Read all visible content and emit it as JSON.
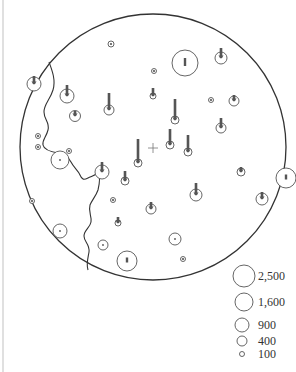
{
  "diagram": {
    "frame_line": {
      "x": 3,
      "y1": 0,
      "y2": 372,
      "color": "#cccccc"
    },
    "boundary_circle": {
      "cx": 153,
      "cy": 147,
      "r": 133,
      "color": "#333333"
    },
    "center_mark": {
      "x": 153,
      "y": 148,
      "size": 5,
      "symbol": "plus-icon"
    },
    "colors": {
      "stroke": "#333333",
      "site_ring": "#555555",
      "arrow": "#555555",
      "divider": "#333333"
    },
    "divider_path": "M 49 62 C 52 70, 56 80, 53 90 C 50 100, 44 104, 44 112 C 44 120, 50 122, 48 130 C 46 138, 42 140, 43 145 C 44 150, 52 152, 58 153 C 64 155, 68 156, 71 162 C 74 168, 78 170, 80 175 C 82 180, 84 180, 88 178 C 92 176, 97 175, 98 172 C 100 176, 100 182, 98 190 C 96 196, 92 200, 90 205 C 88 212, 92 216, 91 222 C 90 228, 84 230, 84 236 C 84 242, 90 244, 89 252 C 88 258, 86 264, 88 270",
    "sites": [
      {
        "cx": 34,
        "cy": 84,
        "r": 7,
        "arrow": 6
      },
      {
        "cx": 67,
        "cy": 96,
        "r": 7,
        "arrow": 9
      },
      {
        "cx": 75,
        "cy": 116,
        "r": 5.5,
        "arrow": 3
      },
      {
        "cx": 111,
        "cy": 44,
        "r": 3,
        "arrow": 0
      },
      {
        "cx": 109,
        "cy": 110,
        "r": 5,
        "arrow": 15
      },
      {
        "cx": 185,
        "cy": 63,
        "r": 13,
        "arrow": 0,
        "inner_bar": 8
      },
      {
        "cx": 221,
        "cy": 58,
        "r": 6,
        "arrow": 8
      },
      {
        "cx": 154,
        "cy": 71,
        "r": 2.5,
        "arrow": 0
      },
      {
        "cx": 153,
        "cy": 96,
        "r": 3,
        "arrow": 6
      },
      {
        "cx": 175,
        "cy": 120,
        "r": 4,
        "arrow": 19
      },
      {
        "cx": 211,
        "cy": 100,
        "r": 2.5,
        "arrow": 0
      },
      {
        "cx": 234,
        "cy": 101,
        "r": 5,
        "arrow": 4
      },
      {
        "cx": 221,
        "cy": 128,
        "r": 5,
        "arrow": 8
      },
      {
        "cx": 170,
        "cy": 145,
        "r": 4,
        "arrow": 14
      },
      {
        "cx": 188,
        "cy": 152,
        "r": 4,
        "arrow": 15
      },
      {
        "cx": 138,
        "cy": 163,
        "r": 4,
        "arrow": 22
      },
      {
        "cx": 38,
        "cy": 136,
        "r": 2.5,
        "arrow": 0
      },
      {
        "cx": 38,
        "cy": 147,
        "r": 2.5,
        "arrow": 0
      },
      {
        "cx": 60,
        "cy": 160,
        "r": 9,
        "arrow": 0,
        "dot": true
      },
      {
        "cx": 69,
        "cy": 151,
        "r": 2.5,
        "arrow": 0
      },
      {
        "cx": 102,
        "cy": 172,
        "r": 7,
        "arrow": 8
      },
      {
        "cx": 125,
        "cy": 181,
        "r": 4,
        "arrow": 8
      },
      {
        "cx": 113,
        "cy": 200,
        "r": 2.5,
        "arrow": 0
      },
      {
        "cx": 32,
        "cy": 201,
        "r": 2.5,
        "arrow": 0
      },
      {
        "cx": 241,
        "cy": 172,
        "r": 4,
        "arrow": 3
      },
      {
        "cx": 196,
        "cy": 195,
        "r": 6,
        "arrow": 10
      },
      {
        "cx": 286,
        "cy": 178,
        "r": 10,
        "arrow": 0,
        "inner_bar": 5
      },
      {
        "cx": 262,
        "cy": 199,
        "r": 6,
        "arrow": 5
      },
      {
        "cx": 151,
        "cy": 209,
        "r": 5,
        "arrow": 5
      },
      {
        "cx": 60,
        "cy": 231,
        "r": 7,
        "arrow": 0,
        "dot": true
      },
      {
        "cx": 118,
        "cy": 223,
        "r": 3,
        "arrow": 4
      },
      {
        "cx": 175,
        "cy": 239,
        "r": 6,
        "arrow": 0,
        "dot": true
      },
      {
        "cx": 103,
        "cy": 245,
        "r": 5,
        "arrow": 0,
        "dot": true
      },
      {
        "cx": 127,
        "cy": 261,
        "r": 10,
        "arrow": 0,
        "inner_bar": 5
      },
      {
        "cx": 183,
        "cy": 259,
        "r": 2.5,
        "arrow": 0
      }
    ],
    "legend": {
      "items": [
        {
          "label": "2,500",
          "cx": 244,
          "cy": 276,
          "r": 11
        },
        {
          "label": "1,600",
          "cx": 244,
          "cy": 302,
          "r": 9
        },
        {
          "label": "900",
          "cx": 242,
          "cy": 325,
          "r": 7
        },
        {
          "label": "400",
          "cx": 242,
          "cy": 341,
          "r": 5
        },
        {
          "label": "100",
          "cx": 242,
          "cy": 354,
          "r": 2.5
        }
      ],
      "label_x": 258
    }
  }
}
